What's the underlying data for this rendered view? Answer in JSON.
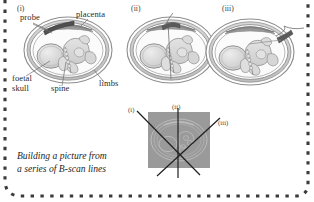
{
  "figure": {
    "caption": "Building a picture from\na series of B-scan lines",
    "border_color": "#3b3b3b",
    "ink_color": "#7a7a7a",
    "panels": [
      {
        "id": "panel-i",
        "roman": "(i)"
      },
      {
        "id": "panel-ii",
        "roman": "(ii)"
      },
      {
        "id": "panel-iii",
        "roman": "(iii)"
      }
    ],
    "anatomy_labels": [
      {
        "name": "probe",
        "text": "probe"
      },
      {
        "name": "placenta",
        "text": "placenta"
      },
      {
        "name": "foetal-skull",
        "text": "foetal\nskull"
      },
      {
        "name": "spine",
        "text": "spine"
      },
      {
        "name": "limbs",
        "text": "limbs"
      }
    ],
    "scan_diagram": {
      "name": "composite-scan-diagram",
      "box_fill": "#9a9a9a",
      "lines": [
        {
          "label": "(i)",
          "name": "scan-line-i"
        },
        {
          "label": "(ii)",
          "name": "scan-line-ii"
        },
        {
          "label": "(iii)",
          "name": "scan-line-iii"
        }
      ]
    }
  }
}
